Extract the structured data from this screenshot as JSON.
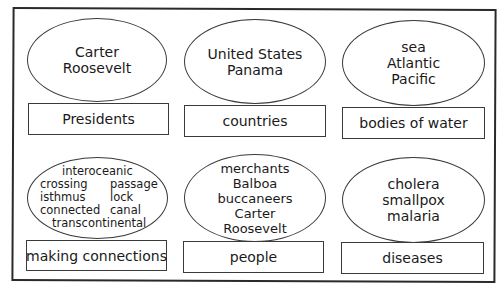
{
  "worksheet": {
    "title_fragment": " ",
    "cards": [
      {
        "category": "Presidents",
        "words": [
          "Carter",
          "Roosevelt"
        ]
      },
      {
        "category": "countries",
        "words": [
          "United States",
          "Panama"
        ]
      },
      {
        "category": "bodies of water",
        "words": [
          "sea",
          "Atlantic",
          "Pacific"
        ]
      },
      {
        "category": "making connections",
        "words": [
          "interoceanic",
          "crossing",
          "passage",
          "isthmus",
          "lock",
          "connected",
          "canal",
          "transcontinental"
        ]
      },
      {
        "category": "people",
        "words": [
          "merchants",
          "Balboa",
          "buccaneers",
          "Carter",
          "Roosevelt"
        ]
      },
      {
        "category": "diseases",
        "words": [
          "cholera",
          "smallpox",
          "malaria"
        ]
      }
    ]
  },
  "colors": {
    "line": "#3a3a3a",
    "text": "#1a1a1a",
    "background": "#ffffff"
  }
}
